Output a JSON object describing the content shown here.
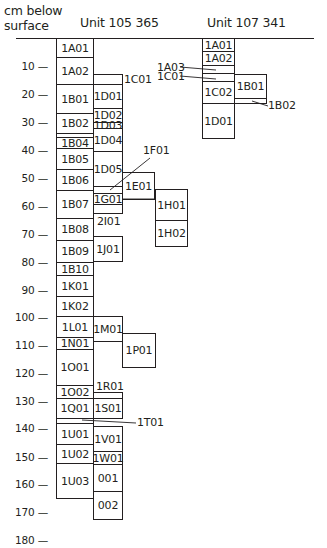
{
  "header": {
    "axis_title_line1": "cm below",
    "axis_title_line2": "surface",
    "unit_a": "Unit 105 365",
    "unit_b": "Unit 107 341"
  },
  "axis": {
    "unit": "cm below surface",
    "ticks": [
      {
        "label": "10 —",
        "y": 60
      },
      {
        "label": "20 —",
        "y": 88
      },
      {
        "label": "30 —",
        "y": 116
      },
      {
        "label": "40 —",
        "y": 144
      },
      {
        "label": "50 —",
        "y": 172
      },
      {
        "label": "60 —",
        "y": 200
      },
      {
        "label": "70 —",
        "y": 228
      },
      {
        "label": "80 —",
        "y": 256
      },
      {
        "label": "90 —",
        "y": 284
      },
      {
        "label": "100 —",
        "y": 311
      },
      {
        "label": "110 —",
        "y": 339
      },
      {
        "label": "120 —",
        "y": 367
      },
      {
        "label": "130 —",
        "y": 395
      },
      {
        "label": "140 —",
        "y": 422
      },
      {
        "label": "150 —",
        "y": 451
      },
      {
        "label": "160 —",
        "y": 478
      },
      {
        "label": "170 —",
        "y": 506
      },
      {
        "label": "180 —",
        "y": 534
      }
    ]
  },
  "unit_105365": {
    "boxes": [
      {
        "id": "1A01",
        "label": "1A01",
        "x": 56,
        "y": 38,
        "w": 38,
        "h": 20
      },
      {
        "id": "1A02",
        "label": "1A02",
        "x": 56,
        "y": 57,
        "w": 38,
        "h": 28
      },
      {
        "id": "1B01",
        "label": "1B01",
        "x": 56,
        "y": 84,
        "w": 38,
        "h": 30
      },
      {
        "id": "1B02",
        "label": "1B02",
        "x": 56,
        "y": 113,
        "w": 38,
        "h": 21
      },
      {
        "id": "1B03",
        "label": "",
        "x": 56,
        "y": 133,
        "w": 38,
        "h": 5
      },
      {
        "id": "1B04",
        "label": "1B04",
        "x": 56,
        "y": 137,
        "w": 38,
        "h": 12
      },
      {
        "id": "1B05",
        "label": "1B05",
        "x": 56,
        "y": 148,
        "w": 38,
        "h": 22
      },
      {
        "id": "1B06",
        "label": "1B06",
        "x": 56,
        "y": 169,
        "w": 38,
        "h": 22
      },
      {
        "id": "1B07",
        "label": "1B07",
        "x": 56,
        "y": 190,
        "w": 38,
        "h": 29
      },
      {
        "id": "1B08",
        "label": "1B08",
        "x": 56,
        "y": 218,
        "w": 38,
        "h": 23
      },
      {
        "id": "1B09",
        "label": "1B09",
        "x": 56,
        "y": 240,
        "w": 38,
        "h": 23
      },
      {
        "id": "1B10",
        "label": "1B10",
        "x": 56,
        "y": 262,
        "w": 38,
        "h": 14
      },
      {
        "id": "1K01",
        "label": "1K01",
        "x": 56,
        "y": 275,
        "w": 38,
        "h": 22
      },
      {
        "id": "1K02",
        "label": "1K02",
        "x": 56,
        "y": 296,
        "w": 38,
        "h": 21
      },
      {
        "id": "1L01",
        "label": "1L01",
        "x": 56,
        "y": 316,
        "w": 38,
        "h": 22
      },
      {
        "id": "1N01",
        "label": "1N01",
        "x": 56,
        "y": 337,
        "w": 38,
        "h": 13
      },
      {
        "id": "1O01",
        "label": "1O01",
        "x": 56,
        "y": 349,
        "w": 38,
        "h": 37
      },
      {
        "id": "1O02",
        "label": "1O02",
        "x": 56,
        "y": 385,
        "w": 38,
        "h": 14
      },
      {
        "id": "1Q01",
        "label": "1Q01",
        "x": 56,
        "y": 398,
        "w": 38,
        "h": 21
      },
      {
        "id": "1T01box",
        "label": "",
        "x": 56,
        "y": 418,
        "w": 38,
        "h": 6
      },
      {
        "id": "1U01",
        "label": "1U01",
        "x": 56,
        "y": 423,
        "w": 38,
        "h": 22
      },
      {
        "id": "1U02",
        "label": "1U02",
        "x": 56,
        "y": 444,
        "w": 38,
        "h": 20
      },
      {
        "id": "1U03",
        "label": "1U03",
        "x": 56,
        "y": 463,
        "w": 38,
        "h": 36
      },
      {
        "id": "1C01",
        "label": "",
        "x": 93,
        "y": 74,
        "w": 30,
        "h": 11
      },
      {
        "id": "1D01",
        "label": "1D01",
        "x": 93,
        "y": 84,
        "w": 30,
        "h": 25
      },
      {
        "id": "1D02",
        "label": "1D02",
        "x": 93,
        "y": 108,
        "w": 30,
        "h": 15
      },
      {
        "id": "1D03",
        "label": "1D03",
        "x": 93,
        "y": 122,
        "w": 30,
        "h": 7
      },
      {
        "id": "1D04",
        "label": "1D04",
        "x": 93,
        "y": 128,
        "w": 30,
        "h": 24
      },
      {
        "id": "1D05",
        "label": "1D05",
        "x": 93,
        "y": 151,
        "w": 30,
        "h": 36
      },
      {
        "id": "1F01box",
        "label": "",
        "x": 93,
        "y": 186,
        "w": 30,
        "h": 8
      },
      {
        "id": "1G01",
        "label": "1G01",
        "x": 93,
        "y": 193,
        "w": 30,
        "h": 12
      },
      {
        "id": "2I01box",
        "label": "",
        "x": 93,
        "y": 204,
        "w": 30,
        "h": 10
      },
      {
        "id": "1J01",
        "label": "1J01",
        "x": 93,
        "y": 236,
        "w": 30,
        "h": 26
      },
      {
        "id": "1M01",
        "label": "1M01",
        "x": 93,
        "y": 316,
        "w": 30,
        "h": 26
      },
      {
        "id": "1R01box",
        "label": "",
        "x": 93,
        "y": 392,
        "w": 30,
        "h": 7
      },
      {
        "id": "1S01",
        "label": "1S01",
        "x": 93,
        "y": 398,
        "w": 30,
        "h": 21
      },
      {
        "id": "1V01",
        "label": "1V01",
        "x": 93,
        "y": 426,
        "w": 30,
        "h": 26
      },
      {
        "id": "1W01",
        "label": "1W01",
        "x": 93,
        "y": 451,
        "w": 30,
        "h": 14
      },
      {
        "id": "001",
        "label": "001",
        "x": 93,
        "y": 464,
        "w": 30,
        "h": 28
      },
      {
        "id": "002",
        "label": "002",
        "x": 93,
        "y": 491,
        "w": 30,
        "h": 29
      },
      {
        "id": "1E01",
        "label": "1E01",
        "x": 122,
        "y": 172,
        "w": 33,
        "h": 28
      },
      {
        "id": "1H01",
        "label": "1H01",
        "x": 155,
        "y": 189,
        "w": 33,
        "h": 32
      },
      {
        "id": "1H02",
        "label": "1H02",
        "x": 155,
        "y": 220,
        "w": 33,
        "h": 27
      },
      {
        "id": "1P01",
        "label": "1P01",
        "x": 122,
        "y": 333,
        "w": 34,
        "h": 35
      }
    ],
    "external_labels": [
      {
        "id": "1C01",
        "label": "1C01",
        "x": 124,
        "y": 74
      },
      {
        "id": "1F01",
        "label": "1F01",
        "x": 143,
        "y": 145
      },
      {
        "id": "2I01",
        "label": "2I01",
        "x": 97,
        "y": 216
      },
      {
        "id": "1R01",
        "label": "1R01",
        "x": 96,
        "y": 381
      },
      {
        "id": "1T01",
        "label": "1T01",
        "x": 137,
        "y": 417
      }
    ]
  },
  "unit_107341": {
    "boxes": [
      {
        "id": "1A01",
        "label": "1A01",
        "x": 202,
        "y": 38,
        "w": 33,
        "h": 14
      },
      {
        "id": "1A02",
        "label": "1A02",
        "x": 202,
        "y": 51,
        "w": 33,
        "h": 15
      },
      {
        "id": "1A03",
        "label": "",
        "x": 202,
        "y": 65,
        "w": 33,
        "h": 9
      },
      {
        "id": "1C01",
        "label": "",
        "x": 202,
        "y": 73,
        "w": 33,
        "h": 9
      },
      {
        "id": "1C02",
        "label": "1C02",
        "x": 202,
        "y": 81,
        "w": 33,
        "h": 23
      },
      {
        "id": "1D01",
        "label": "1D01",
        "x": 202,
        "y": 103,
        "w": 33,
        "h": 36
      },
      {
        "id": "1B01",
        "label": "1B01",
        "x": 234,
        "y": 74,
        "w": 33,
        "h": 25
      },
      {
        "id": "1B02",
        "label": "",
        "x": 234,
        "y": 98,
        "w": 33,
        "h": 6
      }
    ],
    "external_labels": [
      {
        "id": "1A03",
        "label": "1A03",
        "x": 157,
        "y": 62
      },
      {
        "id": "1C01",
        "label": "1C01",
        "x": 157,
        "y": 71
      },
      {
        "id": "1B02",
        "label": "1B02",
        "x": 268,
        "y": 100
      }
    ]
  }
}
